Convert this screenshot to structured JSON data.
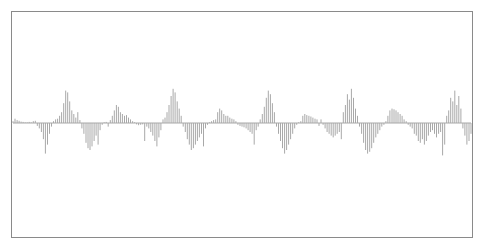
{
  "chart_data": {
    "type": "bar",
    "title": "",
    "xlabel": "",
    "ylabel": "",
    "grid": false,
    "legend": "none",
    "bar_color": "#a8a8a8",
    "frame_color": "#8a8a8a",
    "ylim": [
      -1,
      1
    ],
    "values": [
      0.05,
      0.12,
      0.08,
      0.06,
      0.04,
      0.03,
      0.02,
      0.02,
      0.03,
      0.02,
      0.05,
      0.06,
      -0.08,
      -0.15,
      -0.25,
      -0.45,
      -0.85,
      -0.6,
      -0.3,
      -0.1,
      0.05,
      0.1,
      0.12,
      0.2,
      0.3,
      0.55,
      0.9,
      0.85,
      0.6,
      0.35,
      0.25,
      0.15,
      0.3,
      0.08,
      -0.15,
      -0.3,
      -0.55,
      -0.7,
      -0.75,
      -0.65,
      -0.5,
      -0.35,
      -0.6,
      -0.2,
      -0.05,
      0.02,
      0.03,
      -0.1,
      0.08,
      0.2,
      0.35,
      0.5,
      0.45,
      0.3,
      0.25,
      0.2,
      0.22,
      0.15,
      0.1,
      0.05,
      0.02,
      -0.04,
      -0.06,
      -0.05,
      -0.04,
      -0.5,
      -0.1,
      -0.15,
      -0.25,
      -0.35,
      -0.5,
      -0.65,
      -0.4,
      -0.2,
      0.1,
      0.15,
      0.3,
      0.5,
      0.75,
      0.95,
      0.85,
      0.6,
      0.4,
      0.2,
      -0.1,
      -0.25,
      -0.45,
      -0.6,
      -0.75,
      -0.7,
      -0.6,
      -0.5,
      -0.4,
      -0.3,
      -0.65,
      -0.15,
      -0.05,
      0.02,
      0.05,
      0.08,
      0.1,
      0.3,
      0.4,
      0.35,
      0.25,
      0.2,
      0.2,
      0.15,
      0.12,
      0.1,
      0.05,
      -0.05,
      -0.08,
      -0.1,
      -0.12,
      -0.15,
      -0.2,
      -0.25,
      -0.3,
      -0.6,
      -0.2,
      -0.1,
      0.1,
      0.25,
      0.45,
      0.7,
      0.9,
      0.8,
      0.55,
      0.3,
      -0.1,
      -0.3,
      -0.5,
      -0.7,
      -0.85,
      -0.75,
      -0.6,
      -0.45,
      -0.3,
      -0.15,
      -0.05,
      0.02,
      0.05,
      0.2,
      0.25,
      0.22,
      0.2,
      0.18,
      0.15,
      0.12,
      0.1,
      -0.08,
      0.1,
      -0.05,
      -0.15,
      -0.25,
      -0.3,
      -0.35,
      -0.4,
      -0.35,
      -0.3,
      -0.25,
      -0.45,
      0.3,
      0.5,
      0.8,
      0.65,
      0.95,
      0.7,
      0.4,
      0.2,
      -0.1,
      -0.3,
      -0.55,
      -0.75,
      -0.85,
      -0.8,
      -0.7,
      -0.55,
      -0.4,
      -0.3,
      -0.2,
      -0.1,
      -0.05,
      0.05,
      0.2,
      0.35,
      0.4,
      0.38,
      0.35,
      0.3,
      0.25,
      0.2,
      0.1,
      0.05,
      -0.05,
      -0.1,
      -0.15,
      -0.3,
      -0.35,
      -0.5,
      -0.55,
      -0.45,
      -0.6,
      -0.5,
      -0.35,
      -0.25,
      -0.2,
      -0.3,
      -0.4,
      -0.3,
      -0.25,
      -0.9,
      -0.6,
      0.2,
      0.35,
      0.7,
      0.6,
      0.9,
      0.5,
      0.75,
      0.4,
      -0.15,
      -0.35,
      -0.6,
      -0.5,
      -0.3
    ]
  }
}
